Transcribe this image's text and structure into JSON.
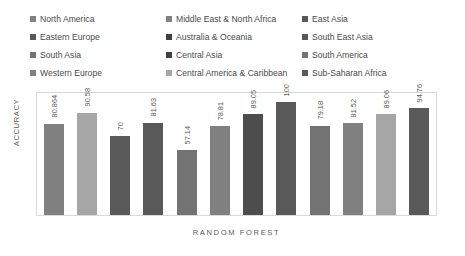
{
  "legend": {
    "rows": [
      [
        {
          "label": "North America",
          "color": "#808080"
        },
        {
          "label": "Middle East & North Africa",
          "color": "#808080"
        },
        {
          "label": "East Asia",
          "color": "#595959"
        }
      ],
      [
        {
          "label": "Eastern Europe",
          "color": "#595959"
        },
        {
          "label": "Australia & Oceania",
          "color": "#404040"
        },
        {
          "label": "South East Asia",
          "color": "#595959"
        }
      ],
      [
        {
          "label": "South Asia",
          "color": "#737373"
        },
        {
          "label": "Central Asia",
          "color": "#404040"
        },
        {
          "label": "South America",
          "color": "#737373"
        }
      ],
      [
        {
          "label": "Western Europe",
          "color": "#808080"
        },
        {
          "label": "Central America & Caribbean",
          "color": "#a6a6a6"
        },
        {
          "label": "Sub-Saharan Africa",
          "color": "#595959"
        }
      ]
    ]
  },
  "chart_data": {
    "type": "bar",
    "title": "",
    "xlabel": "RANDOM FOREST",
    "ylabel": "ACCURACY",
    "ylim": [
      0,
      108
    ],
    "grid": false,
    "legend_position": "top",
    "categories": [
      "North America",
      "Eastern Europe",
      "South Asia",
      "Western Europe",
      "Middle East & North Africa",
      "Australia & Oceania",
      "Central Asia",
      "Central America & Caribbean",
      "East Asia",
      "South East Asia",
      "South America",
      "Sub-Saharan Africa"
    ],
    "values": [
      80.864,
      90.58,
      70,
      81.63,
      57.14,
      78.81,
      89.05,
      100,
      79.18,
      81.52,
      89.06,
      94.76
    ],
    "value_labels": [
      "80.864",
      "90.58",
      "70",
      "81.63",
      "57.14",
      "78.81",
      "89.05",
      "100",
      "79.18",
      "81.52",
      "89.06",
      "94.76"
    ],
    "colors": [
      "#808080",
      "#a6a6a6",
      "#595959",
      "#595959",
      "#737373",
      "#808080",
      "#4d4d4d",
      "#595959",
      "#737373",
      "#808080",
      "#a6a6a6",
      "#595959"
    ]
  }
}
